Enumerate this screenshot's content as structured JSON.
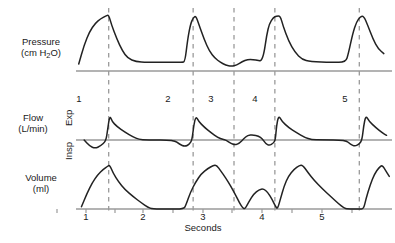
{
  "figure": {
    "kind": "ventilator-waveform-chart",
    "xtitle": "Seconds",
    "colors": {
      "trace": "#222222",
      "baseline": "#9a9a9a",
      "dashed": "#9a9a9a",
      "text": "#1a1a1a",
      "background": "#ffffff"
    }
  },
  "panels": {
    "pressure": {
      "label_line1": "Pressure",
      "label_line2_pre": "(cm H",
      "label_line2_sub": "2",
      "label_line2_post": "O)"
    },
    "flow": {
      "label_line1": "Flow",
      "label_line2": "(L/min)",
      "direction_up": "Exp",
      "direction_down": "Insp"
    },
    "volume": {
      "label_line1": "Volume",
      "label_line2": "(ml)"
    }
  },
  "breath_numbers": [
    {
      "label": "1",
      "x": 79
    },
    {
      "label": "2",
      "x": 168
    },
    {
      "label": "3",
      "x": 211
    },
    {
      "label": "4",
      "x": 255
    },
    {
      "label": "5",
      "x": 345
    }
  ],
  "x_ticks": [
    {
      "label": "1",
      "x": 86
    },
    {
      "label": "2",
      "x": 143
    },
    {
      "label": "3",
      "x": 203
    },
    {
      "label": "4",
      "x": 262
    },
    {
      "label": "5",
      "x": 322
    }
  ],
  "chart_data": {
    "type": "line",
    "title": "",
    "xlabel": "Seconds",
    "ylabel": "",
    "grid": false,
    "legend": "none",
    "x": {
      "label": "Seconds",
      "ticks": [
        1,
        2,
        3,
        4,
        5
      ],
      "minor_ticks": [
        1.5,
        2.5,
        3.5,
        4.5,
        5.5
      ],
      "range": [
        0.5,
        6.0
      ]
    },
    "annotations": {
      "breath_markers": [
        {
          "label": "1",
          "seconds": 0.9,
          "type": "end-inspiration-dashed-line"
        },
        {
          "label": "2",
          "seconds": 2.45,
          "type": "end-inspiration-dashed-line"
        },
        {
          "label": "3",
          "seconds": 3.2,
          "type": "end-inspiration-dashed-line"
        },
        {
          "label": "4",
          "seconds": 3.95,
          "type": "end-inspiration-dashed-line"
        },
        {
          "label": "5",
          "seconds": 5.5,
          "type": "end-inspiration-dashed-line"
        }
      ]
    },
    "series": [
      {
        "name": "Pressure",
        "unit": "cm H2O",
        "panel": "pressure",
        "description": "Airway pressure: four mandatory pressure-controlled breaths with rounded rise to peak at the dashed marker, decay to a PEEP plateau above baseline; breath 3 is a small spontaneous breath dipping below the plateau.",
        "points": [
          [
            0.35,
            0.12
          ],
          [
            0.45,
            0.45
          ],
          [
            0.55,
            0.68
          ],
          [
            0.65,
            0.82
          ],
          [
            0.75,
            0.9
          ],
          [
            0.85,
            0.95
          ],
          [
            0.9,
            0.97
          ],
          [
            0.95,
            0.8
          ],
          [
            1.05,
            0.55
          ],
          [
            1.15,
            0.35
          ],
          [
            1.25,
            0.22
          ],
          [
            1.4,
            0.16
          ],
          [
            1.6,
            0.15
          ],
          [
            2.0,
            0.15
          ],
          [
            2.25,
            0.15
          ],
          [
            2.3,
            0.16
          ],
          [
            2.35,
            0.55
          ],
          [
            2.4,
            0.8
          ],
          [
            2.45,
            0.92
          ],
          [
            2.5,
            0.95
          ],
          [
            2.55,
            0.82
          ],
          [
            2.65,
            0.55
          ],
          [
            2.75,
            0.34
          ],
          [
            2.85,
            0.22
          ],
          [
            2.95,
            0.15
          ],
          [
            3.05,
            0.1
          ],
          [
            3.15,
            0.08
          ],
          [
            3.25,
            0.1
          ],
          [
            3.35,
            0.16
          ],
          [
            3.45,
            0.2
          ],
          [
            3.55,
            0.2
          ],
          [
            3.65,
            0.18
          ],
          [
            3.7,
            0.17
          ],
          [
            3.75,
            0.3
          ],
          [
            3.8,
            0.62
          ],
          [
            3.85,
            0.82
          ],
          [
            3.92,
            0.92
          ],
          [
            3.98,
            0.95
          ],
          [
            4.05,
            0.95
          ],
          [
            4.1,
            0.78
          ],
          [
            4.2,
            0.52
          ],
          [
            4.32,
            0.32
          ],
          [
            4.45,
            0.2
          ],
          [
            4.6,
            0.16
          ],
          [
            5.0,
            0.15
          ],
          [
            5.25,
            0.15
          ],
          [
            5.3,
            0.3
          ],
          [
            5.38,
            0.65
          ],
          [
            5.45,
            0.85
          ],
          [
            5.52,
            0.94
          ],
          [
            5.58,
            0.95
          ],
          [
            5.65,
            0.8
          ],
          [
            5.75,
            0.55
          ],
          [
            5.85,
            0.38
          ],
          [
            5.95,
            0.3
          ]
        ]
      },
      {
        "name": "Flow",
        "unit": "L/min",
        "panel": "flow",
        "description": "Flow with negative (Insp) deflection preceding each triggered breath, then a sharp positive (Exp) spike decaying linearly back to zero.",
        "points": [
          [
            0.45,
            0.0
          ],
          [
            0.55,
            -0.3
          ],
          [
            0.65,
            -0.42
          ],
          [
            0.75,
            -0.3
          ],
          [
            0.85,
            -0.05
          ],
          [
            0.88,
            0.4
          ],
          [
            0.92,
            0.95
          ],
          [
            0.96,
            0.72
          ],
          [
            1.05,
            0.52
          ],
          [
            1.2,
            0.3
          ],
          [
            1.35,
            0.12
          ],
          [
            1.45,
            0.02
          ],
          [
            1.6,
            0.0
          ],
          [
            2.1,
            0.0
          ],
          [
            2.2,
            -0.22
          ],
          [
            2.3,
            -0.33
          ],
          [
            2.38,
            -0.22
          ],
          [
            2.43,
            0.0
          ],
          [
            2.46,
            0.55
          ],
          [
            2.5,
            0.92
          ],
          [
            2.55,
            0.72
          ],
          [
            2.65,
            0.5
          ],
          [
            2.78,
            0.28
          ],
          [
            2.9,
            0.1
          ],
          [
            3.0,
            0.02
          ],
          [
            3.05,
            0.0
          ],
          [
            3.15,
            -0.18
          ],
          [
            3.22,
            -0.25
          ],
          [
            3.3,
            -0.16
          ],
          [
            3.38,
            0.05
          ],
          [
            3.45,
            0.18
          ],
          [
            3.55,
            0.2
          ],
          [
            3.65,
            0.15
          ],
          [
            3.72,
            0.05
          ],
          [
            3.78,
            -0.18
          ],
          [
            3.85,
            -0.28
          ],
          [
            3.92,
            -0.16
          ],
          [
            3.96,
            0.0
          ],
          [
            3.98,
            0.55
          ],
          [
            4.02,
            0.95
          ],
          [
            4.08,
            0.72
          ],
          [
            4.2,
            0.48
          ],
          [
            4.35,
            0.28
          ],
          [
            4.5,
            0.1
          ],
          [
            4.62,
            0.01
          ],
          [
            4.8,
            0.0
          ],
          [
            5.25,
            0.0
          ],
          [
            5.34,
            -0.22
          ],
          [
            5.42,
            -0.32
          ],
          [
            5.5,
            -0.2
          ],
          [
            5.55,
            0.0
          ],
          [
            5.58,
            0.55
          ],
          [
            5.62,
            0.95
          ],
          [
            5.68,
            0.72
          ],
          [
            5.8,
            0.48
          ],
          [
            5.92,
            0.28
          ],
          [
            6.0,
            0.18
          ]
        ]
      },
      {
        "name": "Volume",
        "unit": "ml",
        "panel": "volume",
        "description": "Tidal volume rising to a peak at end-inspiration then decaying back to zero; breath 3 delivers a noticeably smaller spontaneous tidal volume.",
        "points": [
          [
            0.4,
            0.05
          ],
          [
            0.5,
            0.35
          ],
          [
            0.6,
            0.6
          ],
          [
            0.7,
            0.78
          ],
          [
            0.8,
            0.9
          ],
          [
            0.88,
            0.97
          ],
          [
            0.92,
            1.0
          ],
          [
            0.98,
            0.82
          ],
          [
            1.08,
            0.62
          ],
          [
            1.2,
            0.44
          ],
          [
            1.35,
            0.28
          ],
          [
            1.5,
            0.14
          ],
          [
            1.62,
            0.04
          ],
          [
            1.7,
            0.0
          ],
          [
            2.0,
            0.0
          ],
          [
            2.28,
            0.0
          ],
          [
            2.32,
            0.1
          ],
          [
            2.4,
            0.38
          ],
          [
            2.5,
            0.62
          ],
          [
            2.6,
            0.8
          ],
          [
            2.72,
            0.92
          ],
          [
            2.82,
            0.99
          ],
          [
            2.88,
            1.0
          ],
          [
            2.96,
            0.86
          ],
          [
            3.05,
            0.7
          ],
          [
            3.14,
            0.52
          ],
          [
            3.22,
            0.34
          ],
          [
            3.3,
            0.14
          ],
          [
            3.36,
            0.02
          ],
          [
            3.4,
            0.0
          ],
          [
            3.48,
            0.18
          ],
          [
            3.56,
            0.34
          ],
          [
            3.66,
            0.44
          ],
          [
            3.74,
            0.46
          ],
          [
            3.82,
            0.38
          ],
          [
            3.9,
            0.22
          ],
          [
            3.96,
            0.06
          ],
          [
            4.0,
            0.0
          ],
          [
            4.05,
            0.22
          ],
          [
            4.12,
            0.52
          ],
          [
            4.2,
            0.75
          ],
          [
            4.3,
            0.9
          ],
          [
            4.4,
            0.99
          ],
          [
            4.46,
            1.0
          ],
          [
            4.55,
            0.84
          ],
          [
            4.68,
            0.64
          ],
          [
            4.82,
            0.46
          ],
          [
            4.98,
            0.28
          ],
          [
            5.12,
            0.12
          ],
          [
            5.22,
            0.02
          ],
          [
            5.28,
            0.0
          ],
          [
            5.5,
            0.0
          ],
          [
            5.58,
            0.0
          ],
          [
            5.62,
            0.22
          ],
          [
            5.7,
            0.55
          ],
          [
            5.78,
            0.8
          ],
          [
            5.86,
            0.94
          ],
          [
            5.92,
            1.0
          ],
          [
            5.98,
            0.88
          ],
          [
            6.05,
            0.74
          ]
        ]
      }
    ]
  }
}
